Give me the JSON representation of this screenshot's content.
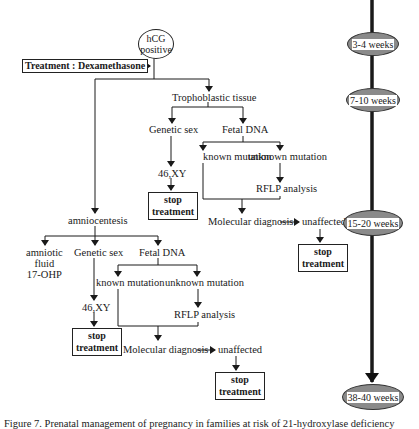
{
  "diagram": {
    "start": {
      "line1": "hCG",
      "line2": "positive"
    },
    "treatment_box": "Treatment : Dexamethasone",
    "cvs_branch": {
      "tissue": "Trophoblastic tissue",
      "genetic_sex": "Genetic sex",
      "fetal_dna": "Fetal DNA",
      "karyotype": "46,XY",
      "stop_box": {
        "line1": "stop",
        "line2": "treatment"
      },
      "known_mutation": "known mutation",
      "unknown_mutation": "unknown mutation",
      "rflp": "RFLP analysis",
      "molecular_diagnosis": "Molecular diagnosis",
      "unaffected": "unaffected",
      "stop_box_2": {
        "line1": "stop",
        "line2": "treatment"
      }
    },
    "amnio_branch": {
      "procedure": "amniocentesis",
      "amniotic": {
        "line1": "amniotic",
        "line2": "fluid",
        "line3": "17-OHP"
      },
      "genetic_sex": "Genetic sex",
      "fetal_dna": "Fetal DNA",
      "karyotype": "46,XY",
      "stop_box": {
        "line1": "stop",
        "line2": "treatment"
      },
      "known_mutation": "known mutation",
      "unknown_mutation": "unknown mutation",
      "rflp": "RFLP analysis",
      "molecular_diagnosis": "Molecular diagnosis",
      "unaffected": "unaffected",
      "stop_box_2": {
        "line1": "stop",
        "line2": "treatment"
      }
    },
    "timeline": [
      {
        "label": "3-4 weeks"
      },
      {
        "label": "7-10 weeks"
      },
      {
        "label": "15-20 weeks"
      },
      {
        "label": "38-40 weeks"
      }
    ],
    "colors": {
      "ellipse_fill": "#8a8a8a",
      "line": "#1a1a1a"
    }
  },
  "caption": "Figure 7. Prenatal management of pregnancy in families at risk of 21-hydroxylase deficiency"
}
